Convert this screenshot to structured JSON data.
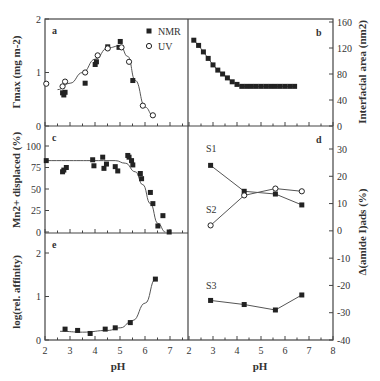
{
  "figure": {
    "xlabel": "pH",
    "left_xticks": [
      "2",
      "3",
      "4",
      "5",
      "6",
      "7"
    ],
    "right_xticks": [
      "2",
      "3",
      "4",
      "5",
      "6",
      "7",
      "8"
    ],
    "colors": {
      "ink": "#333333",
      "marker": "#222222",
      "line": "#555555",
      "background": "#ffffff"
    }
  },
  "panels": {
    "a": {
      "label": "a",
      "ylabel": "Γmax (mg m-2)",
      "yticks": [
        "0",
        "1",
        "2"
      ],
      "legend": [
        "NMR",
        "UV"
      ]
    },
    "b": {
      "label": "b",
      "ylabel": "Interfacial area (nm2)",
      "yticks": [
        "0",
        "40",
        "80",
        "120",
        "160"
      ]
    },
    "c": {
      "label": "c",
      "ylabel": "Mn2+ displaced (%)",
      "yticks": [
        "0",
        "25",
        "50",
        "75",
        "100"
      ]
    },
    "d": {
      "label": "d",
      "ylabel": "Δ(amide I)ads (%)",
      "yticks": [
        "-40",
        "-30",
        "-20",
        "-10",
        "0",
        "10",
        "20",
        "30"
      ],
      "series_labels": [
        "S1",
        "S2",
        "S3"
      ]
    },
    "e": {
      "label": "e",
      "ylabel": "log(rel. affinity)",
      "yticks": [
        "0",
        "1",
        "2"
      ]
    }
  },
  "chart_data": [
    {
      "panel": "a",
      "type": "scatter",
      "title": "",
      "xlabel": "pH",
      "ylabel": "Γmax (mg m-2)",
      "xlim": [
        2,
        7
      ],
      "ylim": [
        0,
        2
      ],
      "legend_position": "upper right",
      "series": [
        {
          "name": "NMR",
          "marker": "filled-square",
          "x": [
            2.7,
            2.75,
            2.8,
            3.6,
            4.0,
            4.05,
            4.5,
            4.95,
            5.0,
            5.5
          ],
          "y": [
            0.62,
            0.58,
            0.63,
            0.8,
            1.15,
            1.2,
            1.48,
            1.47,
            1.58,
            0.85
          ]
        },
        {
          "name": "UV",
          "marker": "open-circle",
          "x": [
            2.05,
            2.7,
            2.8,
            3.6,
            4.1,
            4.5,
            5.05,
            5.35,
            5.9,
            6.3
          ],
          "y": [
            0.79,
            0.74,
            0.83,
            1.0,
            1.32,
            1.45,
            1.47,
            1.2,
            0.38,
            0.2
          ]
        },
        {
          "name": "fit",
          "type": "line",
          "x": [
            2.5,
            3.0,
            3.5,
            4.0,
            4.5,
            5.0,
            5.3,
            5.6,
            6.0,
            6.3
          ],
          "y": [
            0.68,
            0.8,
            1.0,
            1.25,
            1.46,
            1.5,
            1.3,
            0.85,
            0.35,
            0.2
          ]
        }
      ]
    },
    {
      "panel": "b",
      "type": "line",
      "xlabel": "pH",
      "ylabel": "Interfacial area (nm2)",
      "xlim": [
        2,
        8
      ],
      "ylim": [
        0,
        160
      ],
      "x": [
        2.2,
        2.4,
        2.6,
        2.8,
        3.0,
        3.2,
        3.4,
        3.6,
        3.8,
        4.0,
        4.2,
        4.4,
        4.6,
        4.8,
        5.0,
        5.2,
        5.4,
        5.6,
        5.8,
        6.0,
        6.2,
        6.4
      ],
      "y": [
        132,
        124,
        114,
        104,
        94,
        86,
        80,
        74,
        68,
        64,
        61,
        61,
        61,
        61,
        61,
        61,
        61,
        61,
        61,
        61,
        61,
        61
      ]
    },
    {
      "panel": "c",
      "type": "scatter",
      "xlabel": "pH",
      "ylabel": "Mn2+ displaced (%)",
      "xlim": [
        2,
        7
      ],
      "ylim": [
        0,
        100
      ],
      "series": [
        {
          "name": "data",
          "marker": "filled-square",
          "x": [
            2.05,
            2.7,
            2.75,
            2.85,
            3.9,
            3.95,
            4.3,
            4.35,
            4.45,
            4.8,
            4.9,
            5.3,
            5.35,
            5.45,
            5.5,
            5.8,
            5.85,
            6.2,
            6.3,
            6.7
          ],
          "y": [
            83,
            70,
            72,
            75,
            84,
            77,
            87,
            74,
            79,
            76,
            71,
            89,
            87,
            83,
            78,
            68,
            62,
            46,
            33,
            19
          ]
        },
        {
          "name": "fit",
          "type": "line",
          "x": [
            2.0,
            4.8,
            5.2,
            5.6,
            5.9,
            6.2,
            6.5,
            6.8
          ],
          "y": [
            83,
            83,
            80,
            70,
            55,
            33,
            10,
            0
          ]
        }
      ],
      "note": "additional points at pH ~6.5 (7%) and ~6.9 (0%)"
    },
    {
      "panel": "d",
      "type": "line",
      "xlabel": "pH",
      "ylabel": "Δ(amide I)ads (%)",
      "xlim": [
        2,
        8
      ],
      "ylim": [
        -40,
        30
      ],
      "x": [
        2.9,
        4.3,
        5.6,
        6.7
      ],
      "series": [
        {
          "name": "S1",
          "marker": "filled-square",
          "values": [
            24,
            14.5,
            13.5,
            9.5
          ]
        },
        {
          "name": "S2",
          "marker": "open-circle",
          "values": [
            2,
            13,
            15.5,
            14.5
          ]
        },
        {
          "name": "S3",
          "marker": "filled-square",
          "values": [
            -25.5,
            -27,
            -29,
            -23.5
          ]
        }
      ]
    },
    {
      "panel": "e",
      "type": "scatter",
      "xlabel": "pH",
      "ylabel": "log(rel. affinity)",
      "xlim": [
        2,
        7
      ],
      "ylim": [
        0,
        2
      ],
      "series": [
        {
          "name": "data",
          "marker": "filled-square",
          "x": [
            2.8,
            3.3,
            3.8,
            4.4,
            4.8,
            5.4,
            6.4
          ],
          "y": [
            0.25,
            0.22,
            0.15,
            0.25,
            0.28,
            0.4,
            1.4
          ]
        },
        {
          "name": "fit",
          "type": "line",
          "x": [
            2.6,
            3.5,
            4.5,
            5.0,
            5.5,
            6.0,
            6.4
          ],
          "y": [
            0.2,
            0.18,
            0.22,
            0.28,
            0.45,
            0.85,
            1.4
          ]
        }
      ]
    }
  ]
}
